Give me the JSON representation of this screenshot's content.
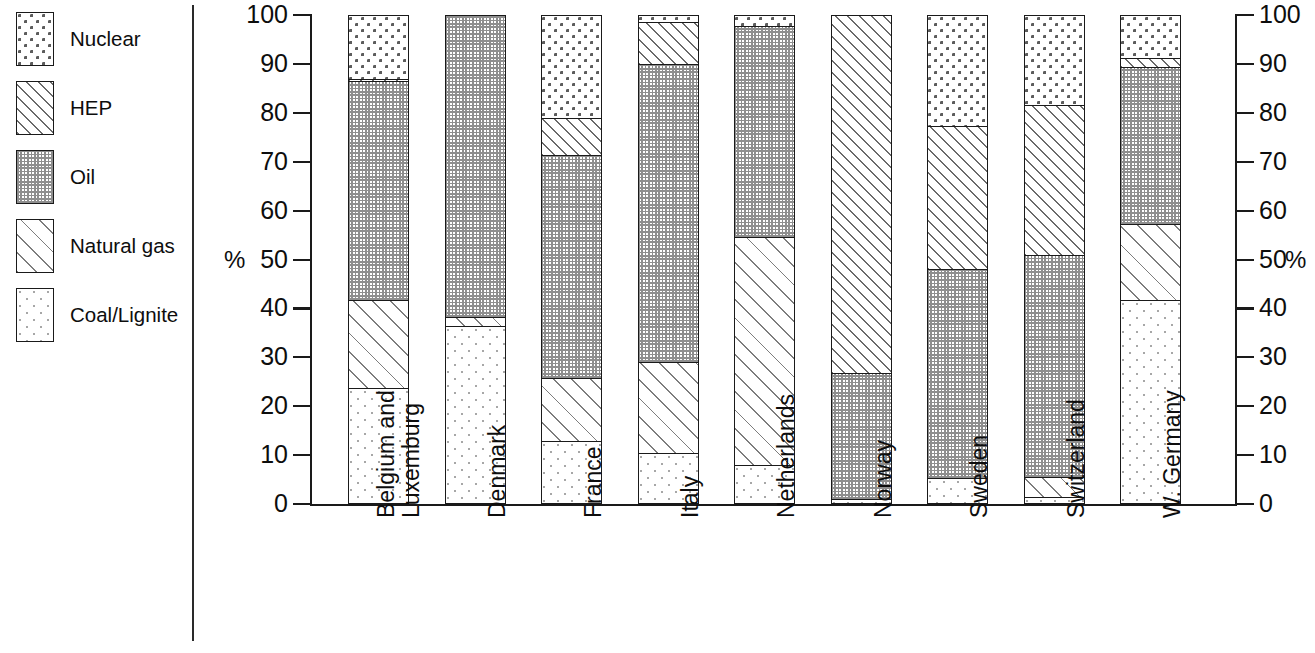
{
  "chart_data": {
    "type": "bar",
    "subtype": "stacked-percentage-column",
    "title": "",
    "xlabel": "",
    "ylabel": "%",
    "ylabel_right": "%",
    "ylim": [
      0,
      100
    ],
    "yticks": [
      0,
      10,
      20,
      30,
      40,
      50,
      60,
      70,
      80,
      90,
      100
    ],
    "ytick_labels": [
      "0",
      "10",
      "20",
      "30",
      "40",
      "50",
      "60",
      "70",
      "80",
      "90",
      "100"
    ],
    "grid": false,
    "legend_position": "left-outside",
    "stack_order_bottom_to_top": [
      "Coal/Lignite",
      "Natural gas",
      "Oil",
      "HEP",
      "Nuclear"
    ],
    "categories": [
      "Belgium and\nLuxemburg",
      "Denmark",
      "France",
      "Italy",
      "Netherlands",
      "Norway",
      "Sweden",
      "Switzerland",
      "W. Germany"
    ],
    "category_labels": [
      "Belgium and",
      "Luxemburg",
      "Denmark",
      "France",
      "Italy",
      "Netherlands",
      "Norway",
      "Sweden",
      "Switzerland",
      "W. Germany"
    ],
    "series": [
      {
        "name": "Coal/Lignite",
        "pattern": "sparse-light-dots",
        "values": [
          23.8,
          36.5,
          12.8,
          10.5,
          8.0,
          1.0,
          5.3,
          1.5,
          41.7
        ]
      },
      {
        "name": "Natural gas",
        "pattern": "sparse-diagonal-hatch",
        "values": [
          17.9,
          1.8,
          13.0,
          18.5,
          46.5,
          0.0,
          0.0,
          4.0,
          15.6
        ]
      },
      {
        "name": "Oil",
        "pattern": "fine-dense-dot-grid",
        "values": [
          44.8,
          61.7,
          45.5,
          61.0,
          43.3,
          25.7,
          42.7,
          45.5,
          32.0
        ]
      },
      {
        "name": "HEP",
        "pattern": "dense-diagonal-hatch",
        "values": [
          0.4,
          0.0,
          7.7,
          8.5,
          0.0,
          73.3,
          29.3,
          30.5,
          2.0
        ]
      },
      {
        "name": "Nuclear",
        "pattern": "medium-sparse-dots",
        "values": [
          13.1,
          0.0,
          21.0,
          1.5,
          2.2,
          0.0,
          22.7,
          18.5,
          8.7
        ]
      }
    ],
    "cumulative_tops": {
      "Belgium and Luxemburg": [
        23.8,
        41.7,
        86.5,
        86.9,
        100.0
      ],
      "Denmark": [
        36.5,
        38.3,
        100.0,
        100.0,
        100.0
      ],
      "France": [
        12.8,
        25.8,
        71.3,
        79.0,
        100.0
      ],
      "Italy": [
        10.5,
        29.0,
        90.0,
        98.5,
        100.0
      ],
      "Netherlands": [
        8.0,
        54.5,
        97.8,
        97.8,
        100.0
      ],
      "Norway": [
        1.0,
        1.0,
        26.7,
        100.0,
        100.0
      ],
      "Sweden": [
        5.3,
        5.3,
        48.0,
        77.3,
        100.0
      ],
      "Switzerland": [
        1.5,
        5.5,
        51.0,
        81.5,
        100.0
      ],
      "W. Germany": [
        41.7,
        57.3,
        89.3,
        91.3,
        100.0
      ]
    }
  },
  "legend": {
    "items": [
      {
        "label": "Nuclear",
        "pattern_name": "nuclear-swatch"
      },
      {
        "label": "HEP",
        "pattern_name": "hep-swatch"
      },
      {
        "label": "Oil",
        "pattern_name": "oil-swatch"
      },
      {
        "label": "Natural gas",
        "pattern_name": "natural-gas-swatch"
      },
      {
        "label": "Coal/Lignite",
        "pattern_name": "coal-lignite-swatch"
      }
    ]
  },
  "axes": {
    "left_unit": "%",
    "right_unit": "%",
    "tick_labels": [
      "100",
      "90",
      "80",
      "70",
      "60",
      "50",
      "40",
      "30",
      "20",
      "10",
      "0"
    ]
  },
  "colors": {
    "ink": "#1a1a1a",
    "background": "#ffffff",
    "pattern_mid": "#7d7d7d",
    "pattern_light": "#a7a7a7",
    "pattern_dark": "#5d5d5d"
  }
}
